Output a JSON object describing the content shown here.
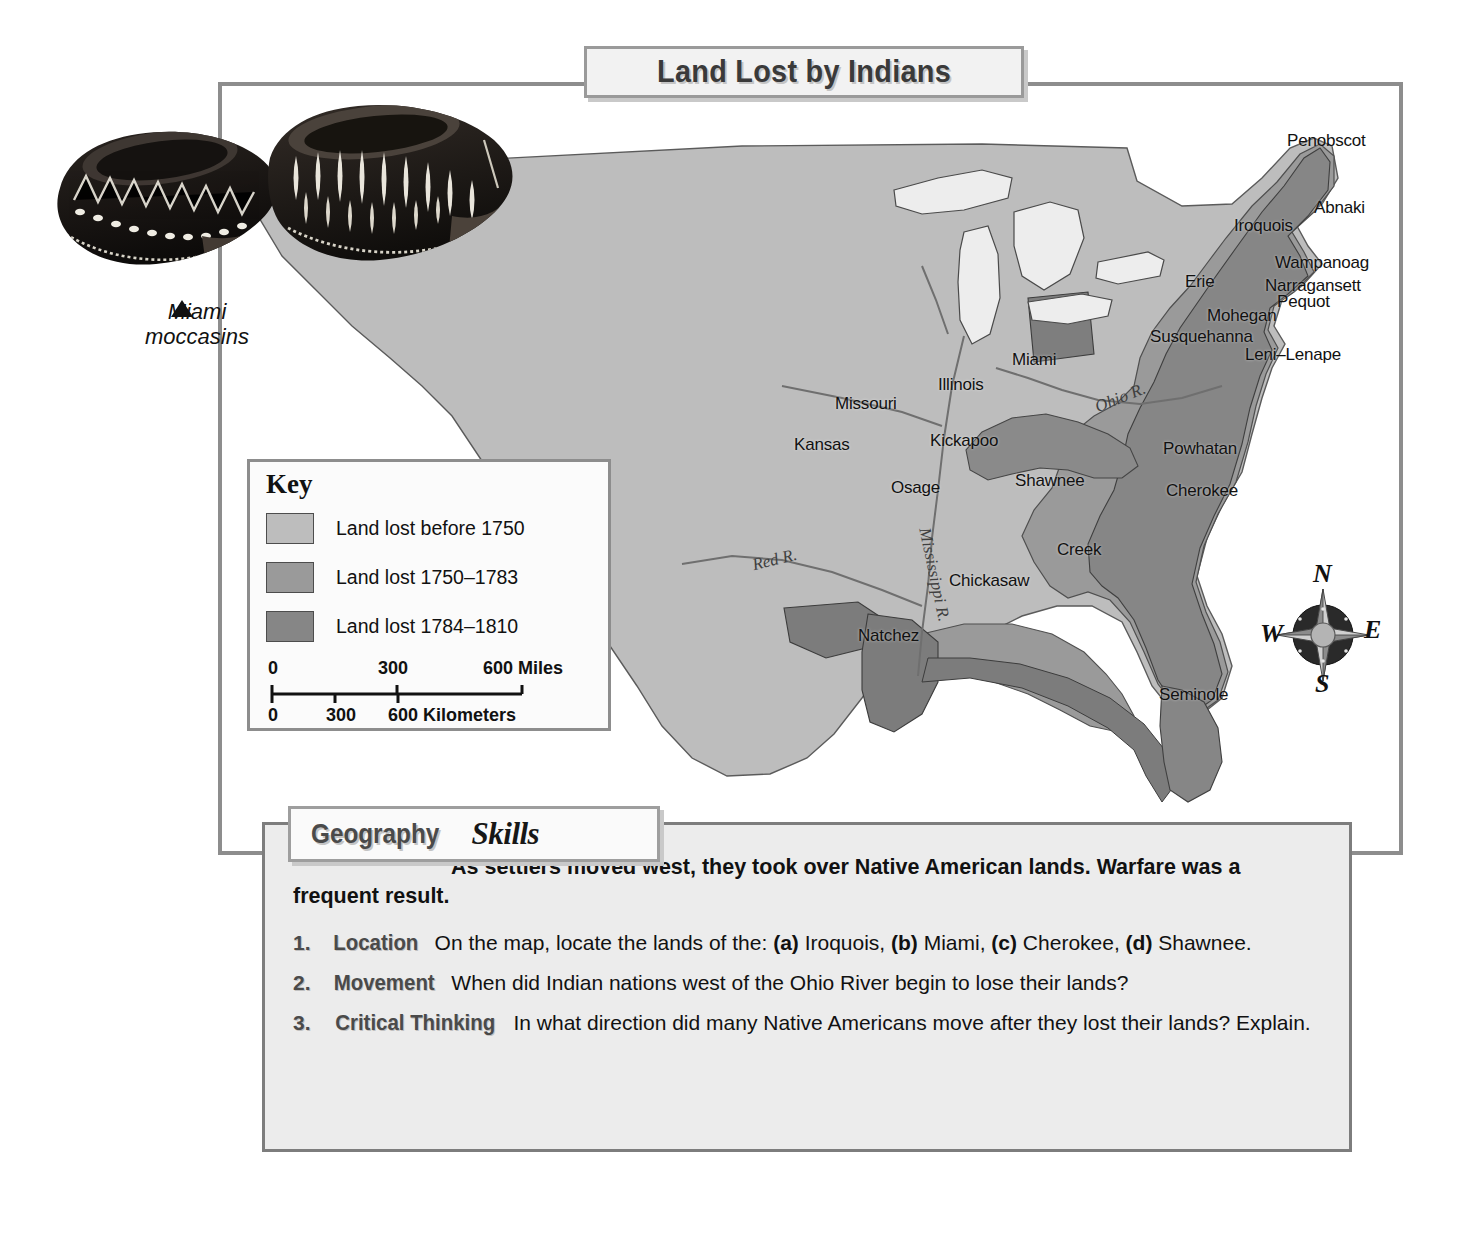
{
  "title": "Land Lost by Indians",
  "photo": {
    "caption_line1": "Miami",
    "caption_line2": "moccasins",
    "alt": "two-beaded-moccasins"
  },
  "key": {
    "heading": "Key",
    "entries": [
      {
        "label": "Land lost before 1750",
        "color": "#bdbdbd"
      },
      {
        "label": "Land lost 1750–1783",
        "color": "#9a9a9a"
      },
      {
        "label": "Land lost 1784–1810",
        "color": "#868686"
      }
    ],
    "scale": {
      "miles_0": "0",
      "miles_300": "300",
      "miles_600": "600 Miles",
      "km_0": "0",
      "km_300": "300",
      "km_600": "600 Kilometers"
    }
  },
  "compass": {
    "n": "N",
    "e": "E",
    "s": "S",
    "w": "W"
  },
  "map": {
    "tribes": [
      {
        "name": "Penobscot",
        "x": 1065,
        "y": 45
      },
      {
        "name": "Abnaki",
        "x": 1092,
        "y": 112
      },
      {
        "name": "Iroquois",
        "x": 1012,
        "y": 130
      },
      {
        "name": "Wampanoag",
        "x": 1053,
        "y": 167
      },
      {
        "name": "Narragansett",
        "x": 1043,
        "y": 190
      },
      {
        "name": "Pequot",
        "x": 1055,
        "y": 206
      },
      {
        "name": "Erie",
        "x": 963,
        "y": 186
      },
      {
        "name": "Mohegan",
        "x": 985,
        "y": 220
      },
      {
        "name": "Susquehanna",
        "x": 928,
        "y": 241
      },
      {
        "name": "Leni–Lenape",
        "x": 1023,
        "y": 259
      },
      {
        "name": "Miami",
        "x": 790,
        "y": 264
      },
      {
        "name": "Illinois",
        "x": 716,
        "y": 289
      },
      {
        "name": "Missouri",
        "x": 613,
        "y": 308
      },
      {
        "name": "Kansas",
        "x": 572,
        "y": 349
      },
      {
        "name": "Kickapoo",
        "x": 708,
        "y": 345
      },
      {
        "name": "Osage",
        "x": 669,
        "y": 392
      },
      {
        "name": "Shawnee",
        "x": 793,
        "y": 385
      },
      {
        "name": "Powhatan",
        "x": 941,
        "y": 353
      },
      {
        "name": "Cherokee",
        "x": 944,
        "y": 395
      },
      {
        "name": "Creek",
        "x": 835,
        "y": 454
      },
      {
        "name": "Chickasaw",
        "x": 727,
        "y": 485
      },
      {
        "name": "Natchez",
        "x": 636,
        "y": 540
      },
      {
        "name": "Seminole",
        "x": 937,
        "y": 599
      }
    ],
    "rivers": [
      {
        "name": "Ohio R.",
        "x": 872,
        "y": 302,
        "rot": -22
      },
      {
        "name": "Mississippi R.",
        "x": 712,
        "y": 460,
        "rot": 78
      },
      {
        "name": "Red R.",
        "x": 530,
        "y": 464,
        "rot": -14
      }
    ]
  },
  "geography_skills": {
    "tab_word1": "Geography",
    "tab_word2": "Skills",
    "intro": "As settlers moved west, they took over Native American lands. Warfare was a frequent result.",
    "questions": [
      {
        "num": "1.",
        "category": "Location",
        "text": "On the map, locate the lands of the: (a) Iroquois, (b) Miami, (c) Cherokee, (d) Shawnee."
      },
      {
        "num": "2.",
        "category": "Movement",
        "text": "When did Indian nations west of the Ohio River begin to lose their lands?"
      },
      {
        "num": "3.",
        "category": "Critical Thinking",
        "text": "In what direction did many Native Americans move after they lost their lands? Explain."
      }
    ]
  },
  "colors": {
    "land_base": "#b9b9b9",
    "lost_before_1750": "#bdbdbd",
    "lost_1750_1783": "#9a9a9a",
    "lost_1784_1810": "#868686",
    "frame": "#8d8d8d",
    "panel_bg": "#ececec",
    "ink": "#111111"
  }
}
